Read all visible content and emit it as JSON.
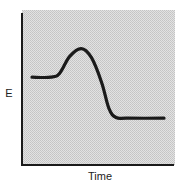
{
  "chart_data": {
    "type": "line",
    "title": "",
    "xlabel": "Time",
    "ylabel": "E",
    "grid": false,
    "legend": "none",
    "xlim": [
      0,
      10
    ],
    "ylim": [
      0,
      10
    ],
    "x_ticks": [],
    "y_ticks": [],
    "series": [
      {
        "name": "energy-profile",
        "color": "#1a1a1a",
        "points": [
          [
            0.0,
            5.6
          ],
          [
            1.3,
            5.6
          ],
          [
            1.9,
            5.9
          ],
          [
            2.6,
            7.2
          ],
          [
            3.4,
            7.8
          ],
          [
            4.1,
            7.1
          ],
          [
            4.8,
            5.2
          ],
          [
            5.3,
            3.2
          ],
          [
            5.8,
            2.5
          ],
          [
            6.6,
            2.45
          ],
          [
            9.1,
            2.45
          ]
        ]
      }
    ],
    "annotations": [],
    "background_fill": "#d6d6d6",
    "axis_color": "#1a1a1a"
  }
}
